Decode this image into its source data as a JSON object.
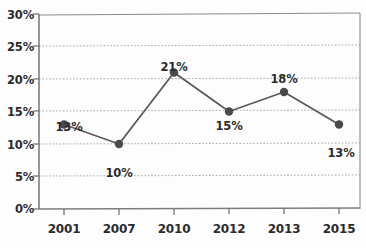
{
  "chart_data": {
    "type": "line",
    "title": "",
    "subtitle": "",
    "xlabel": "",
    "ylabel": "",
    "categories": [
      "2001",
      "2007",
      "2010",
      "2012",
      "2013",
      "2015"
    ],
    "values": [
      13,
      10,
      21,
      15,
      18,
      13
    ],
    "point_labels": [
      "13%",
      "10%",
      "21%",
      "15%",
      "18%",
      "13%"
    ],
    "ylim": [
      0,
      30
    ],
    "y_ticks": [
      0,
      5,
      10,
      15,
      20,
      25,
      30
    ],
    "y_tick_labels": [
      "0%",
      "5%",
      "10%",
      "15%",
      "20%",
      "25%",
      "30%"
    ],
    "x_tick_labels": [
      "2001",
      "2007",
      "2010",
      "2012",
      "2013",
      "2015"
    ],
    "grid": true,
    "grid_axis": "y",
    "legend": false,
    "legend_position": "none",
    "series": [
      {
        "name": "",
        "values": [
          13,
          10,
          21,
          15,
          18,
          13
        ]
      }
    ],
    "colors": {
      "line": "#5a5a5a",
      "marker": "#4a4a4a",
      "grid": "#9a9a9a",
      "axis": "#6b6b6b",
      "text": "#2b2b2b",
      "background": "#fdfdfd"
    },
    "marker": "circle",
    "label_positions": [
      "above",
      "below",
      "above",
      "below",
      "above",
      "below"
    ]
  }
}
